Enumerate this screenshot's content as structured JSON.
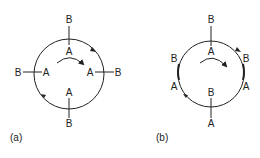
{
  "figures": [
    {
      "caption": "(a)",
      "description": "Circle with four radial B–A dipoles; A points inward toward center at all positions",
      "labels": {
        "top_outer": "B",
        "top_inner": "A",
        "right_inner": "A",
        "right_outer": "B",
        "bottom_inner": "A",
        "bottom_outer": "B",
        "left_outer": "B",
        "left_inner": "A"
      },
      "rotation": "clockwise"
    },
    {
      "caption": "(b)",
      "description": "Circle where top and bottom dipoles are radial, left and right dipoles lie tangent along the circle",
      "labels": {
        "top_outer": "B",
        "top_inner": "A",
        "right_top": "B",
        "right_bottom": "A",
        "bottom_inner": "B",
        "bottom_outer": "A",
        "left_top": "B",
        "left_bottom": "A"
      },
      "rotation": "clockwise"
    }
  ],
  "colors": {
    "stroke": "#222222",
    "background": "#ffffff"
  }
}
